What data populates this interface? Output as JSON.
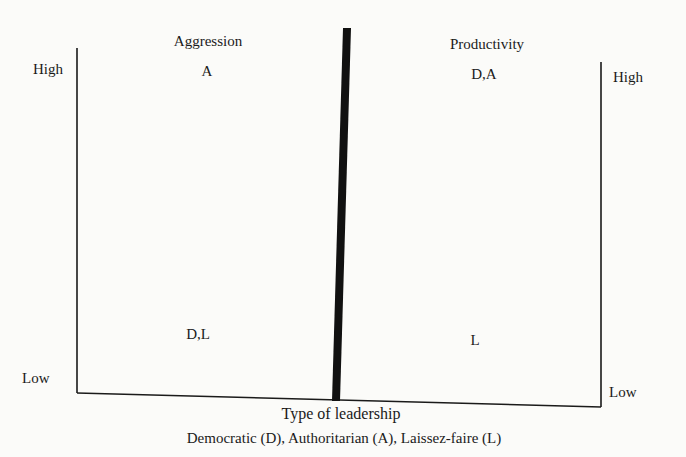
{
  "left_panel": {
    "title": "Aggression",
    "high_label": "High",
    "low_label": "Low",
    "high_value": "A",
    "low_value": "D,L"
  },
  "right_panel": {
    "title": "Productivity",
    "high_label": "High",
    "low_label": "Low",
    "high_value": "D,A",
    "low_value": "L"
  },
  "x_axis": {
    "label": "Type of leadership",
    "legend": "Democratic (D), Authoritarian (A), Laissez-faire (L)"
  },
  "colors": {
    "ink": "#1a1a1a",
    "background": "#fbfbf9"
  }
}
